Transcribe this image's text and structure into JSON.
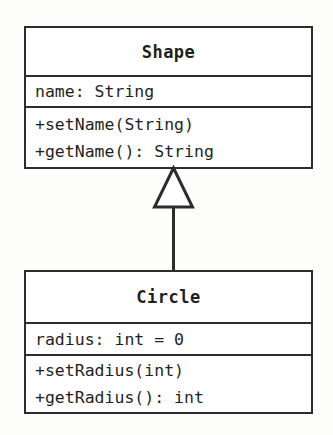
{
  "diagram": {
    "type": "uml-class-diagram",
    "background_color": "#fdfdfc",
    "line_color": "#2c2c2c",
    "text_color": "#1f1f1f"
  },
  "classes": [
    {
      "id": "shape",
      "name": "Shape",
      "attributes": [
        "name: String"
      ],
      "operations": [
        "+setName(String)",
        "+getName(): String"
      ]
    },
    {
      "id": "circle",
      "name": "Circle",
      "attributes": [
        "radius: int = 0"
      ],
      "operations": [
        "+setRadius(int)",
        "+getRadius(): int"
      ]
    }
  ],
  "relationships": [
    {
      "kind": "generalization",
      "label": "",
      "from": "Circle",
      "to": "Shape",
      "arrow": "hollow-triangle"
    }
  ]
}
